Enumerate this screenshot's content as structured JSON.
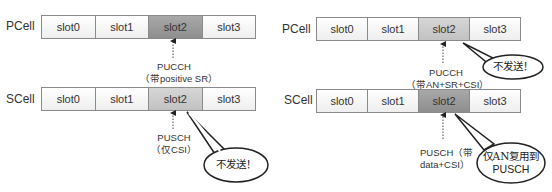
{
  "left_diagram": {
    "pcell": {
      "label": "PCell",
      "slots": [
        "slot0",
        "slot1",
        "slot2",
        "slot3"
      ],
      "highlighted_slot": 2
    },
    "pcell_annotation": {
      "line1": "PUCCH",
      "line2": "（带positive SR）"
    },
    "scell": {
      "label": "SCell",
      "slots": [
        "slot0",
        "slot1",
        "slot2",
        "slot3"
      ],
      "highlighted_slot": 2
    },
    "scell_annotation": {
      "line1": "PUSCH",
      "line2": "（仅CSI）"
    },
    "callout": "不发送！"
  },
  "right_diagram": {
    "pcell": {
      "label": "PCell",
      "slots": [
        "slot0",
        "slot1",
        "slot2",
        "slot3"
      ],
      "highlighted_slot": 2
    },
    "pcell_annotation": {
      "line1": "PUCCH",
      "line2": "（带AN+SR+CSI）"
    },
    "pcell_callout": "不发送！",
    "scell": {
      "label": "SCell",
      "slots": [
        "slot0",
        "slot1",
        "slot2",
        "slot3"
      ],
      "highlighted_slot": 2
    },
    "scell_annotation": {
      "line1": "PUSCH（带",
      "line2": "data+CSI）"
    },
    "scell_callout": {
      "line1": "仅AN复用到",
      "line2": "PUSCH"
    }
  },
  "colors": {
    "slot_default": "#f4f4f4",
    "slot_dark": "#9a9a9a",
    "slot_light": "#cccccc",
    "border": "#8a8a8a"
  }
}
